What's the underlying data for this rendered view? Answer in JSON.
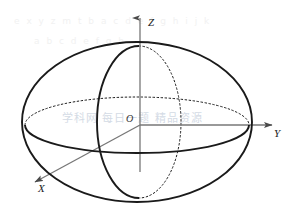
{
  "figure": {
    "type": "3d-ellipsoid-coordinate-diagram",
    "background_color": "#ffffff",
    "stroke_color": "#1a1a1a",
    "axis_color": "#6b6b6b",
    "watermark_color": "#aab8cc",
    "labels": {
      "z_axis": "Z",
      "y_axis": "Y",
      "x_axis": "X",
      "origin": "O"
    },
    "watermark": {
      "main": "学科网  每日一题 精品资源",
      "top_bleed": "e x y z  m t  b a c d e f g h i j k",
      "bottom_bleed": "a b c  d e f g h"
    },
    "geometry": {
      "origin": {
        "x": 140,
        "y": 125
      },
      "silhouette_ellipse": {
        "cx": 137,
        "cy": 122,
        "rx": 115,
        "ry": 80,
        "style": "solid"
      },
      "equator_ellipse": {
        "cx": 137,
        "cy": 125,
        "rx": 112,
        "ry": 28,
        "back_half": "dotted",
        "front_half": "solid"
      },
      "meridian_ellipse": {
        "cx": 137,
        "cy": 122,
        "rx": 42,
        "ry": 76,
        "left_half": "solid",
        "right_half": "dotted"
      },
      "z_axis_segment": {
        "x1": 140,
        "y1": 172,
        "x2": 140,
        "y2": 16,
        "arrow": "up"
      },
      "y_axis_segment": {
        "x1": 140,
        "y1": 125,
        "x2": 276,
        "y2": 125,
        "arrow": "right"
      },
      "x_axis_segment": {
        "x1": 140,
        "y1": 125,
        "x2": 31,
        "y2": 184,
        "arrow": "down-left"
      },
      "top_pole": {
        "x": 140,
        "y": 47
      },
      "bottom_pole": {
        "x": 140,
        "y": 198
      }
    }
  }
}
